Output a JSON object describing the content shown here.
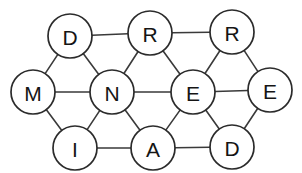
{
  "diagram": {
    "type": "undirected-graph",
    "background_color": "#ffffff",
    "node_fill_color": "#ffffff",
    "node_stroke_color": "#2b2b2b",
    "edge_color": "#3a3a3a",
    "label_color": "#151515",
    "node_radius": 22,
    "node_count": 10,
    "edge_count": 19,
    "nodes": [
      {
        "id": "D1",
        "label": "D",
        "x": 70,
        "y": 36,
        "r": 22
      },
      {
        "id": "R1",
        "label": "R",
        "x": 150,
        "y": 33,
        "r": 22
      },
      {
        "id": "R2",
        "label": "R",
        "x": 232,
        "y": 32,
        "r": 22
      },
      {
        "id": "M1",
        "label": "M",
        "x": 33,
        "y": 92,
        "r": 22
      },
      {
        "id": "N1",
        "label": "N",
        "x": 112,
        "y": 92,
        "r": 22
      },
      {
        "id": "E1",
        "label": "E",
        "x": 193,
        "y": 92,
        "r": 22
      },
      {
        "id": "E2",
        "label": "E",
        "x": 270,
        "y": 90,
        "r": 22
      },
      {
        "id": "I1",
        "label": "I",
        "x": 75,
        "y": 148,
        "r": 22
      },
      {
        "id": "A1",
        "label": "A",
        "x": 153,
        "y": 148,
        "r": 22
      },
      {
        "id": "D2",
        "label": "D",
        "x": 232,
        "y": 147,
        "r": 22
      }
    ],
    "edges": [
      {
        "from": "D1",
        "to": "R1"
      },
      {
        "from": "R1",
        "to": "R2"
      },
      {
        "from": "D1",
        "to": "M1"
      },
      {
        "from": "D1",
        "to": "N1"
      },
      {
        "from": "R1",
        "to": "N1"
      },
      {
        "from": "R1",
        "to": "E1"
      },
      {
        "from": "R2",
        "to": "E1"
      },
      {
        "from": "R2",
        "to": "E2"
      },
      {
        "from": "M1",
        "to": "N1"
      },
      {
        "from": "N1",
        "to": "E1"
      },
      {
        "from": "E1",
        "to": "E2"
      },
      {
        "from": "M1",
        "to": "I1"
      },
      {
        "from": "N1",
        "to": "I1"
      },
      {
        "from": "N1",
        "to": "A1"
      },
      {
        "from": "E1",
        "to": "A1"
      },
      {
        "from": "E1",
        "to": "D2"
      },
      {
        "from": "I1",
        "to": "A1"
      },
      {
        "from": "A1",
        "to": "D2"
      },
      {
        "from": "D2",
        "to": "E2"
      }
    ]
  }
}
